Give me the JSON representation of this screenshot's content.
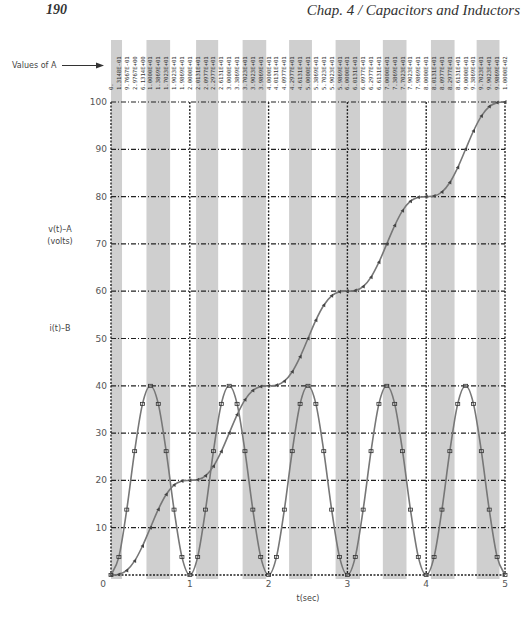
{
  "page": {
    "number": "190",
    "chapter_title": "Chap. 4 / Capacitors and Inductors"
  },
  "annotations": {
    "values_of_a": "Values of A",
    "v_label_line1": "v(t)–A",
    "v_label_line2": "(volts)",
    "i_label": "i(t)–B",
    "xlabel": "t(sec)"
  },
  "chart_data": {
    "type": "line",
    "title": "",
    "xlabel": "t(sec)",
    "ylabel": "v(t)-A (volts); i(t)-B",
    "xlim": [
      0,
      5
    ],
    "ylim": [
      0,
      100
    ],
    "grid": true,
    "x_ticks": [
      0,
      1,
      2,
      3,
      4,
      5
    ],
    "y_ticks": [
      10,
      20,
      30,
      40,
      50,
      60,
      70,
      80,
      90,
      100
    ],
    "x": [
      0.0,
      0.1,
      0.2,
      0.3,
      0.4,
      0.5,
      0.6,
      0.7,
      0.8,
      0.9,
      1.0,
      1.1,
      1.2,
      1.3,
      1.4,
      1.5,
      1.6,
      1.7,
      1.8,
      1.9,
      2.0,
      2.1,
      2.2,
      2.3,
      2.4,
      2.5,
      2.6,
      2.7,
      2.8,
      2.9,
      3.0,
      3.1,
      3.2,
      3.3,
      3.4,
      3.5,
      3.6,
      3.7,
      3.8,
      3.9,
      4.0,
      4.1,
      4.2,
      4.3,
      4.4,
      4.5,
      4.6,
      4.7,
      4.8,
      4.9,
      5.0
    ],
    "series": [
      {
        "name": "v(t) - A",
        "marker": "triangle",
        "values": [
          0,
          0.129,
          0.973,
          2.973,
          6.129,
          10,
          13.871,
          17.027,
          19.027,
          19.871,
          20,
          20.129,
          20.973,
          22.973,
          26.129,
          30,
          33.871,
          37.027,
          39.027,
          39.871,
          40,
          40.129,
          40.973,
          42.973,
          46.129,
          50,
          53.871,
          57.027,
          59.027,
          59.871,
          60,
          60.129,
          60.973,
          62.973,
          66.129,
          70,
          73.871,
          77.027,
          79.027,
          79.871,
          80,
          80.129,
          80.973,
          82.973,
          86.129,
          90,
          93.871,
          97.027,
          99.027,
          99.871,
          100
        ]
      },
      {
        "name": "i(t) - B",
        "marker": "square",
        "values": [
          0,
          3.82,
          13.82,
          26.18,
          36.18,
          40,
          36.18,
          26.18,
          13.82,
          3.82,
          0,
          3.82,
          13.82,
          26.18,
          36.18,
          40,
          36.18,
          26.18,
          13.82,
          3.82,
          0,
          3.82,
          13.82,
          26.18,
          36.18,
          40,
          36.18,
          26.18,
          13.82,
          3.82,
          0,
          3.82,
          13.82,
          26.18,
          36.18,
          40,
          36.18,
          26.18,
          13.82,
          3.82,
          0,
          3.82,
          13.82,
          26.18,
          36.18,
          40,
          36.18,
          26.18,
          13.82,
          3.82,
          0
        ]
      }
    ],
    "values_of_a_labels": [
      "0.",
      "1.3148E-01",
      "9.7667E-01",
      "2.9767E+00",
      "6.1314E+00",
      "1.0000E+01",
      "1.3869E+01",
      "1.7023E+01",
      "1.9023E+01",
      "1.9869E+01",
      "2.0000E+01",
      "2.0131E+01",
      "2.0977E+01",
      "2.2977E+01",
      "2.6131E+01",
      "3.0000E+01",
      "3.3869E+01",
      "3.7023E+01",
      "3.9023E+01",
      "3.9869E+01",
      "4.0000E+01",
      "4.0131E+01",
      "4.0977E+01",
      "4.2977E+01",
      "4.6131E+01",
      "5.0000E+01",
      "5.3869E+01",
      "5.7023E+01",
      "5.9023E+01",
      "5.9869E+01",
      "6.0000E+01",
      "6.0131E+01",
      "6.0977E+01",
      "6.2977E+01",
      "6.6131E+01",
      "7.0000E+01",
      "7.3869E+01",
      "7.7023E+01",
      "7.9023E+01",
      "7.9869E+01",
      "8.0000E+01",
      "8.0131E+01",
      "8.0977E+01",
      "8.2977E+01",
      "8.6131E+01",
      "9.0000E+01",
      "9.3869E+01",
      "9.7023E+01",
      "9.9023E+01",
      "9.9869E+01",
      "1.0000E+02"
    ],
    "shaded_bands_t": [
      [
        0,
        0.14
      ],
      [
        0.45,
        0.75
      ],
      [
        1.08,
        1.36
      ],
      [
        1.67,
        1.97
      ],
      [
        2.26,
        2.55
      ],
      [
        2.85,
        3.16
      ],
      [
        3.45,
        3.75
      ],
      [
        4.06,
        4.36
      ],
      [
        4.64,
        4.93
      ]
    ]
  },
  "colors": {
    "curve": "#777777",
    "band": "#cfcfcf",
    "grid": "#222222",
    "text": "#444444"
  }
}
